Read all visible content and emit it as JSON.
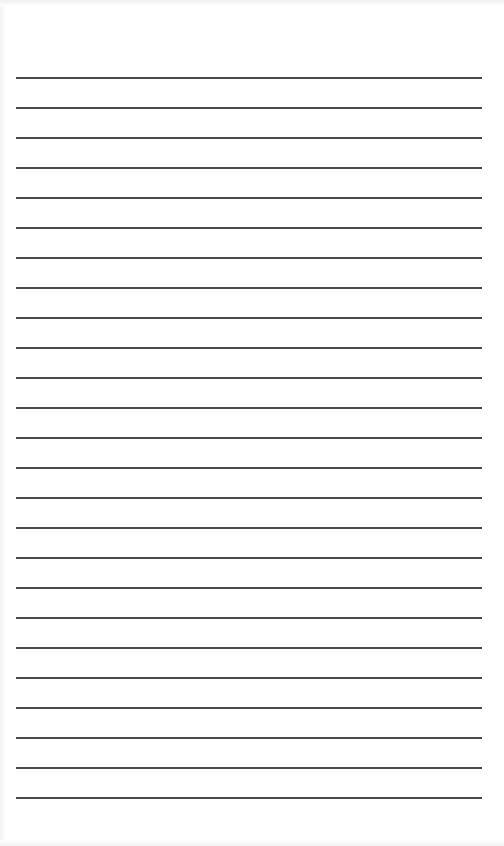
{
  "document": {
    "type": "lined-paper",
    "line_count": 25,
    "first_line_y": 77,
    "line_spacing": 30,
    "line_left": 16,
    "line_width": 466,
    "line_color": "#4a4a4a",
    "background": "#ffffff"
  }
}
